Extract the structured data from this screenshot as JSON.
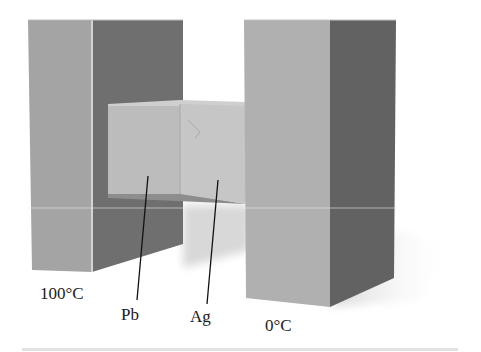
{
  "figure": {
    "labels": {
      "hot_reservoir": "100°C",
      "cold_reservoir": "0°C",
      "lead": "Pb",
      "silver": "Ag"
    },
    "colors": {
      "background": "#ffffff",
      "block_front": "#a3a3a3",
      "block_side": "#6e6e6e",
      "right_front": "#b0b0b0",
      "right_side": "#626262",
      "bar_pb": "#bdbdbd",
      "bar_ag": "#c8c8c8",
      "bar_top": "#cfcfcf",
      "shadow": "#dcdcdc",
      "leader": "#111111",
      "rule": "#e2e2e2"
    }
  }
}
